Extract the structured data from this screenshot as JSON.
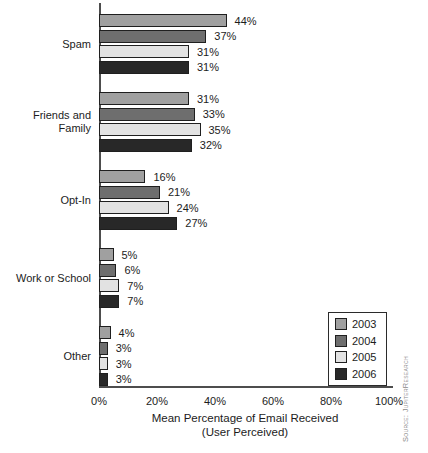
{
  "chart_data": {
    "type": "bar",
    "orientation": "horizontal",
    "title": "",
    "categories": [
      "Spam",
      "Friends and Family",
      "Opt-In",
      "Work or School",
      "Other"
    ],
    "series": [
      {
        "name": "2003",
        "color": "#a0a0a0",
        "values": [
          44,
          31,
          16,
          5,
          4
        ]
      },
      {
        "name": "2004",
        "color": "#6e6e6e",
        "values": [
          37,
          33,
          21,
          6,
          3
        ]
      },
      {
        "name": "2005",
        "color": "#e2e2e2",
        "values": [
          31,
          35,
          24,
          7,
          3
        ]
      },
      {
        "name": "2006",
        "color": "#282828",
        "values": [
          31,
          32,
          27,
          7,
          3
        ]
      }
    ],
    "data_label_suffix": "%",
    "xlabel": "Mean Percentage of Email Received",
    "xlabel_line2": "(User Perceived)",
    "x_ticks": [
      "0%",
      "20%",
      "40%",
      "60%",
      "80%",
      "100%"
    ],
    "xlim": [
      0,
      100
    ],
    "grid": false,
    "legend": {
      "position": "bottom-right",
      "entries": [
        "2003",
        "2004",
        "2005",
        "2006"
      ]
    }
  },
  "source_note": "Source: JupiterResearch",
  "colors": {
    "axis": "#4d4d4d",
    "bar_border": "#1f1f1f",
    "text": "#1c1c1c",
    "source_text": "#8a8a8a"
  }
}
